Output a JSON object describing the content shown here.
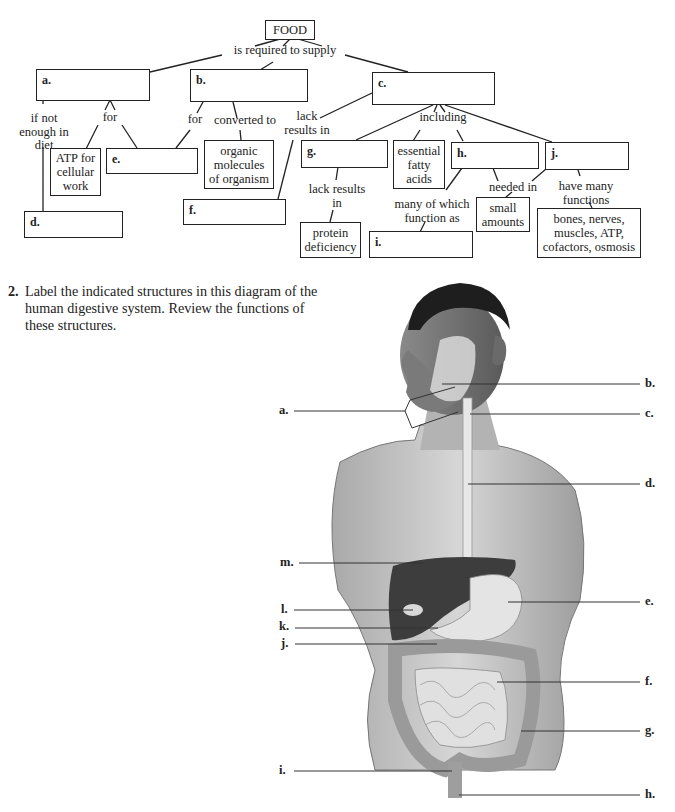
{
  "concept_map": {
    "root": "FOOD",
    "root_link": "is required to supply",
    "boxes": {
      "a": {
        "label": "a.",
        "text": ""
      },
      "b": {
        "label": "b.",
        "text": ""
      },
      "c": {
        "label": "c.",
        "text": ""
      },
      "d": {
        "label": "d.",
        "text": ""
      },
      "e": {
        "label": "e.",
        "text": ""
      },
      "f": {
        "label": "f.",
        "text": ""
      },
      "g": {
        "label": "g.",
        "text": ""
      },
      "h": {
        "label": "h.",
        "text": ""
      },
      "i": {
        "label": "i.",
        "text": ""
      },
      "j": {
        "label": "j.",
        "text": ""
      }
    },
    "given": {
      "atp": "ATP for cellular work",
      "organic": "organic molecules of organism",
      "fatty": "essential fatty acids",
      "protein": "protein deficiency",
      "small": "small amounts",
      "bones": "bones, nerves, muscles, ATP, cofactors, osmosis"
    },
    "links": {
      "if_not": "if not enough in diet",
      "for_a": "for",
      "for_b": "for",
      "converted": "converted to",
      "lack_c": "lack results in",
      "including": "including",
      "lack_g": "lack results in",
      "many": "many of which function as",
      "needed": "needed in",
      "have_many": "have many functions"
    }
  },
  "question": {
    "number": "2.",
    "text": "Label the indicated structures in this diagram of the human digestive system. Review the functions of these structures."
  },
  "anatomy_labels": {
    "a": "a.",
    "b": "b.",
    "c": "c.",
    "d": "d.",
    "e": "e.",
    "f": "f.",
    "g": "g.",
    "h": "h.",
    "i": "i.",
    "j": "j.",
    "k": "k.",
    "l": "l.",
    "m": "m."
  }
}
